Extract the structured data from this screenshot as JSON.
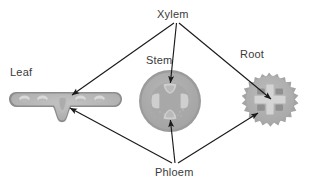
{
  "diagram": {
    "background_color": "#ffffff",
    "label_color": "#3a3a3a",
    "arrow_color": "#1a1a1a",
    "labels": {
      "xylem": "Xylem",
      "phloem": "Phloem",
      "stem": "Stem",
      "root": "Root",
      "leaf": "Leaf"
    },
    "structures": [
      {
        "name": "leaf",
        "label": "Leaf",
        "shape": "elongated-rounded-blade-with-midrib",
        "outline_color": "#8e8e8e",
        "fill_color": "#b4b4b4",
        "vein_color": "#d8d8d8"
      },
      {
        "name": "stem",
        "label": "Stem",
        "shape": "circle-cross-section",
        "outline_color": "#9a9a9a",
        "fill_color": "#ababab",
        "bundle_color": "#cccccc"
      },
      {
        "name": "root",
        "label": "Root",
        "shape": "spiky-star-cross-section",
        "outline_color": "#a0a0a0",
        "fill_color": "#aeaeae",
        "bundle_color": "#d2d2d2"
      }
    ],
    "arrows": [
      {
        "from": "Xylem",
        "to": "Leaf"
      },
      {
        "from": "Xylem",
        "to": "Stem"
      },
      {
        "from": "Xylem",
        "to": "Root"
      },
      {
        "from": "Phloem",
        "to": "Leaf"
      },
      {
        "from": "Phloem",
        "to": "Stem"
      },
      {
        "from": "Phloem",
        "to": "Root"
      }
    ]
  }
}
